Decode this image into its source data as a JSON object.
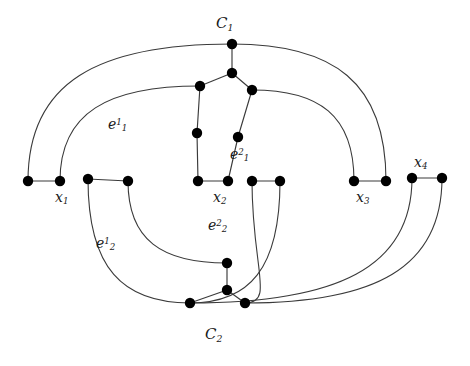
{
  "figure": {
    "kind": "graph-drawing",
    "background_color": "#ffffff",
    "edge_color": "#3a3a3a",
    "vertex_color": "#000000",
    "width": 470,
    "height": 366
  },
  "labels": {
    "c1": {
      "base": "C",
      "sub": "1",
      "x": 216,
      "y": 16
    },
    "c2": {
      "base": "C",
      "sub": "2",
      "x": 205,
      "y": 327
    },
    "x1": {
      "base": "x",
      "sub": "1",
      "x": 55,
      "y": 190
    },
    "x2": {
      "base": "x",
      "sub": "2",
      "x": 213,
      "y": 190
    },
    "x3": {
      "base": "x",
      "sub": "3",
      "x": 356,
      "y": 190
    },
    "x4": {
      "base": "x",
      "sub": "4",
      "x": 414,
      "y": 155
    },
    "e11": {
      "base": "e",
      "sub": "1",
      "sup": "1",
      "x": 108,
      "y": 117
    },
    "e12": {
      "base": "e",
      "sub": "1",
      "sup": "2",
      "x": 230,
      "y": 147
    },
    "e21": {
      "base": "e",
      "sub": "2",
      "sup": "1",
      "x": 96,
      "y": 236
    },
    "e22": {
      "base": "e",
      "sub": "2",
      "sup": "2",
      "x": 208,
      "y": 218
    }
  },
  "graph_data": {
    "vertex_radius": 5.2,
    "vertices": [
      {
        "id": "c1a",
        "x": 232,
        "y": 44,
        "name": "c1-apex"
      },
      {
        "id": "c1b",
        "x": 232,
        "y": 73,
        "name": "c1-center"
      },
      {
        "id": "c1l",
        "x": 200,
        "y": 86,
        "name": "c1-left"
      },
      {
        "id": "c1r",
        "x": 252,
        "y": 90,
        "name": "c1-right"
      },
      {
        "id": "ml",
        "x": 197,
        "y": 133,
        "name": "mid-left-column"
      },
      {
        "id": "mr",
        "x": 238,
        "y": 137,
        "name": "mid-right-column"
      },
      {
        "id": "a1",
        "x": 28,
        "y": 181,
        "name": "x1-left"
      },
      {
        "id": "a2",
        "x": 60,
        "y": 181,
        "name": "x1-right"
      },
      {
        "id": "b1",
        "x": 88,
        "y": 179,
        "name": "pair2-left"
      },
      {
        "id": "b2",
        "x": 128,
        "y": 181,
        "name": "pair2-right"
      },
      {
        "id": "c1v",
        "x": 198,
        "y": 181,
        "name": "x2-left"
      },
      {
        "id": "c2v",
        "x": 228,
        "y": 181,
        "name": "x2-right"
      },
      {
        "id": "d1",
        "x": 252,
        "y": 181,
        "name": "pair4-left"
      },
      {
        "id": "d2",
        "x": 280,
        "y": 181,
        "name": "pair4-right"
      },
      {
        "id": "e1v",
        "x": 354,
        "y": 181,
        "name": "x3-left"
      },
      {
        "id": "e2v",
        "x": 386,
        "y": 181,
        "name": "x3-right"
      },
      {
        "id": "f1",
        "x": 412,
        "y": 178,
        "name": "x4-left"
      },
      {
        "id": "f2",
        "x": 442,
        "y": 178,
        "name": "x4-right"
      },
      {
        "id": "c2a",
        "x": 227,
        "y": 263,
        "name": "c2-top"
      },
      {
        "id": "c2b",
        "x": 227,
        "y": 290,
        "name": "c2-center"
      },
      {
        "id": "c2l",
        "x": 190,
        "y": 303,
        "name": "c2-left"
      },
      {
        "id": "c2r",
        "x": 245,
        "y": 303,
        "name": "c2-right"
      }
    ],
    "straight_edges": [
      [
        "a1",
        "a2"
      ],
      [
        "b1",
        "b2"
      ],
      [
        "c1v",
        "c2v"
      ],
      [
        "d1",
        "d2"
      ],
      [
        "e1v",
        "e2v"
      ],
      [
        "f1",
        "f2"
      ],
      [
        "c1a",
        "c1b"
      ],
      [
        "c1b",
        "c1l"
      ],
      [
        "c1b",
        "c1r"
      ],
      [
        "c1l",
        "ml"
      ],
      [
        "ml",
        "c1v"
      ],
      [
        "c1r",
        "mr"
      ],
      [
        "mr",
        "c2v"
      ],
      [
        "c2a",
        "c2b"
      ],
      [
        "c2b",
        "c2l"
      ],
      [
        "c2b",
        "c2r"
      ]
    ],
    "curved_edges": [
      {
        "from": "a1",
        "to": "c1a",
        "name": "curve-x1left-to-c1apex"
      },
      {
        "from": "a2",
        "to": "c1l",
        "name": "curve-x1right-to-c1left"
      },
      {
        "from": "c1r",
        "to": "e1v",
        "name": "curve-c1right-to-x3left"
      },
      {
        "from": "c1a",
        "to": "e2v",
        "name": "curve-c1apex-to-x3right"
      },
      {
        "from": "b1",
        "to": "c2l",
        "name": "curve-pair2left-to-c2left"
      },
      {
        "from": "b2",
        "to": "c2a",
        "name": "curve-pair2right-to-c2top"
      },
      {
        "from": "d1",
        "to": "c2r",
        "name": "curve-pair4left-to-c2right"
      },
      {
        "from": "d2",
        "to": "c2l",
        "name": "curve-pair4right-to-c2left"
      },
      {
        "from": "f1",
        "to": "c2l",
        "name": "curve-x4left-to-c2left"
      },
      {
        "from": "f2",
        "to": "c2r",
        "name": "curve-x4right-to-c2right"
      }
    ]
  }
}
